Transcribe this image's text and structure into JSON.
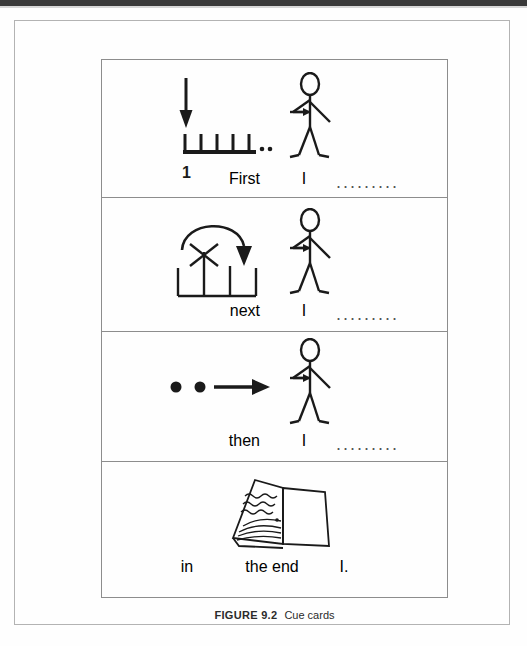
{
  "page": {
    "figure_label": "FIGURE 9.2",
    "figure_caption": "Cue cards"
  },
  "cue_cards": [
    {
      "id": "first",
      "symbol_name": "down-arrow-tally-marks-symbol",
      "symbol_description": "downward arrow pointing to the first of five tally marks on a baseline with trailing dots",
      "tally_number": "1",
      "trailing_dots": "..",
      "figure_name": "stick-figure-pointing-to-self",
      "starter": "First",
      "pronoun": "I",
      "blank_dots": "........."
    },
    {
      "id": "next",
      "symbol_name": "curved-arrow-crossed-tally-symbol",
      "symbol_description": "curved arrow over three tally marks with the middle one crossed out by an X",
      "figure_name": "stick-figure-pointing-to-self",
      "starter": "next",
      "pronoun": "I",
      "blank_dots": "........."
    },
    {
      "id": "then",
      "symbol_name": "two-dots-arrow-symbol",
      "symbol_description": "two filled dots followed by a rightward arrow",
      "figure_name": "stick-figure-pointing-to-self",
      "starter": "then",
      "pronoun": "I",
      "blank_dots": "........."
    },
    {
      "id": "in-the-end",
      "symbol_name": "open-book-icon",
      "symbol_description": "open book with squiggly lines of writing on the left page",
      "starter": "in",
      "middle": "the end",
      "pronoun": "I.",
      "blank_dots": ""
    }
  ],
  "colors": {
    "ink": "#1a1a1a",
    "text": "#2b2b2b",
    "table_border": "#8d8d8d",
    "page_border": "#b3b3b3",
    "scan_band": "#3a3a3a"
  }
}
